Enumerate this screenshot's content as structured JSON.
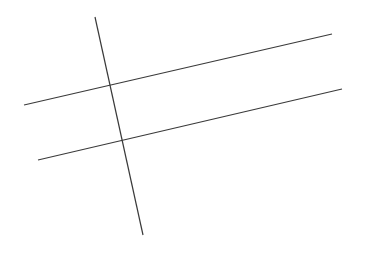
{
  "figure": {
    "width": 366,
    "height": 256,
    "background_color": "#ffffff",
    "stroke_color": "#3a3a3a",
    "stroke_width": 1.2
  },
  "chart_data": {
    "type": "line",
    "title": "",
    "subtitle": "",
    "xlabel": "",
    "ylabel": "",
    "grid": false,
    "legend": "none",
    "xlim": [
      0,
      366
    ],
    "ylim": [
      0,
      256
    ],
    "series": [
      {
        "name": "upper-transversal",
        "values": [
          {
            "x": 24,
            "y": 105
          },
          {
            "x": 332,
            "y": 34
          }
        ]
      },
      {
        "name": "lower-transversal",
        "values": [
          {
            "x": 38,
            "y": 160
          },
          {
            "x": 342,
            "y": 89
          }
        ]
      },
      {
        "name": "steep-crossing-line",
        "values": [
          {
            "x": 95,
            "y": 17
          },
          {
            "x": 143,
            "y": 235
          }
        ]
      }
    ],
    "annotations": [
      {
        "name": "intersection-upper",
        "x": 107,
        "y": 87
      },
      {
        "name": "intersection-lower",
        "x": 112,
        "y": 138
      }
    ]
  },
  "lines": [
    {
      "id": "upper-transversal",
      "x1": 24,
      "y1": 105,
      "x2": 332,
      "y2": 34,
      "color": "#3a3a3a",
      "width": 1.2
    },
    {
      "id": "lower-transversal",
      "x1": 38,
      "y1": 160,
      "x2": 342,
      "y2": 89,
      "color": "#3a3a3a",
      "width": 1.2
    },
    {
      "id": "steep-crossing-line",
      "x1": 95,
      "y1": 17,
      "x2": 143,
      "y2": 235,
      "color": "#3a3a3a",
      "width": 1.2
    }
  ]
}
